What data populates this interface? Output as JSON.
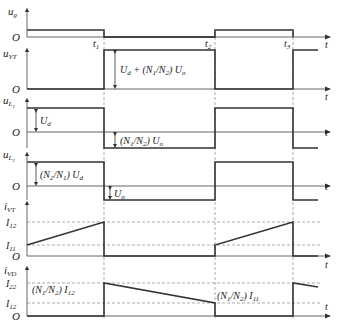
{
  "diagram": {
    "time_axis_label": "t",
    "origin_label": "O",
    "time_marks": [
      "t1",
      "t2",
      "t3"
    ],
    "time_mark_subs": [
      "1",
      "2",
      "3"
    ],
    "rows": [
      {
        "id": "ug",
        "base": "u",
        "sub": "g"
      },
      {
        "id": "uVT",
        "base": "u",
        "sub": "VT"
      },
      {
        "id": "uL1",
        "base": "u",
        "sub": "L",
        "subsub": "1"
      },
      {
        "id": "uL2",
        "base": "u",
        "sub": "L",
        "subsub": "2"
      },
      {
        "id": "iVT",
        "base": "i",
        "sub": "VT"
      },
      {
        "id": "iVD",
        "base": "i",
        "sub": "VD"
      }
    ],
    "annotations": {
      "uVT_amp": "U_d + (N_1/N_2) U_o",
      "uL1_pos": "U_d",
      "uL1_neg": "(N_1/N_2) U_o",
      "uL2_pos": "(N_2/N_1) U_d",
      "uL2_neg": "U_o",
      "iVD_peak": "(N_1/N_2) I_12",
      "iVD_min": "(N_1/N_2) I_11"
    },
    "levels": {
      "iVT": [
        "I12",
        "I11"
      ],
      "iVD": [
        "I22",
        "I12"
      ]
    },
    "colors": {
      "wave": "#333333",
      "axis": "#555555",
      "dash": "#888888"
    }
  }
}
